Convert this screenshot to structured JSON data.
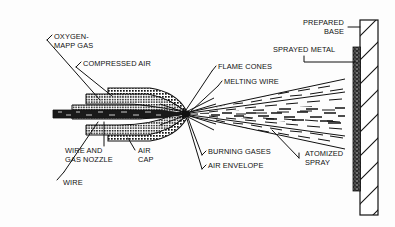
{
  "figure": {
    "kind": "technical-line-diagram",
    "background_color": "#fdfdfd",
    "ink_color": "#111111"
  },
  "labels": [
    {
      "id": "oxygen-mapp-gas",
      "text": "OXYGEN-\nMAPP GAS",
      "x": 54,
      "y": 35,
      "align": "left"
    },
    {
      "id": "compressed-air",
      "text": "COMPRESSED AIR",
      "x": 83,
      "y": 62,
      "align": "left"
    },
    {
      "id": "flame-cones",
      "text": "FLAME CONES",
      "x": 218,
      "y": 65,
      "align": "left"
    },
    {
      "id": "melting-wire",
      "text": "MELTING WIRE",
      "x": 224,
      "y": 80,
      "align": "left"
    },
    {
      "id": "prepared-base",
      "text": "PREPARED\nBASE",
      "x": 290,
      "y": 21,
      "align": "left"
    },
    {
      "id": "sprayed-metal",
      "text": "SPRAYED METAL",
      "x": 275,
      "y": 48,
      "align": "left"
    },
    {
      "id": "wire-and-gas-nozzle",
      "text": "WIRE AND\nGAS NOZZLE",
      "x": 65,
      "y": 149,
      "align": "left"
    },
    {
      "id": "air-cap",
      "text": "AIR\nCAP",
      "x": 137,
      "y": 149,
      "align": "left"
    },
    {
      "id": "wire",
      "text": "WIRE",
      "x": 62,
      "y": 181,
      "align": "left"
    },
    {
      "id": "burning-gases",
      "text": "BURNING GASES",
      "x": 207,
      "y": 150,
      "align": "left"
    },
    {
      "id": "air-envelope",
      "text": "AIR ENVELOPE",
      "x": 207,
      "y": 164,
      "align": "left"
    },
    {
      "id": "atomized-spray",
      "text": "ATOMIZED\nSPRAY",
      "x": 305,
      "y": 152,
      "align": "left"
    }
  ],
  "parts": [
    {
      "id": "wire",
      "description": "dark solid wire bar entering nozzle along centerline"
    },
    {
      "id": "wire-and-gas-nozzle",
      "description": "stacked cross-hatched nozzle bands above and below the wire"
    },
    {
      "id": "air-cap",
      "description": "large cross-hatched lobes forming the outer cap"
    },
    {
      "id": "flame-cones",
      "description": "narrow cones radiating from the nozzle tip"
    },
    {
      "id": "melting-wire",
      "description": "wire tip melting at the convergence point"
    },
    {
      "id": "burning-gases",
      "description": "long straight envelope lines downstream of the tip"
    },
    {
      "id": "air-envelope",
      "description": "outermost straight envelope lines of the spray"
    },
    {
      "id": "atomized-spray",
      "description": "field of short dashes expanding toward the base"
    },
    {
      "id": "sprayed-metal",
      "description": "dark speckled deposited coating on the base face"
    },
    {
      "id": "prepared-base",
      "description": "diagonally hatched substrate plate at the right"
    }
  ]
}
